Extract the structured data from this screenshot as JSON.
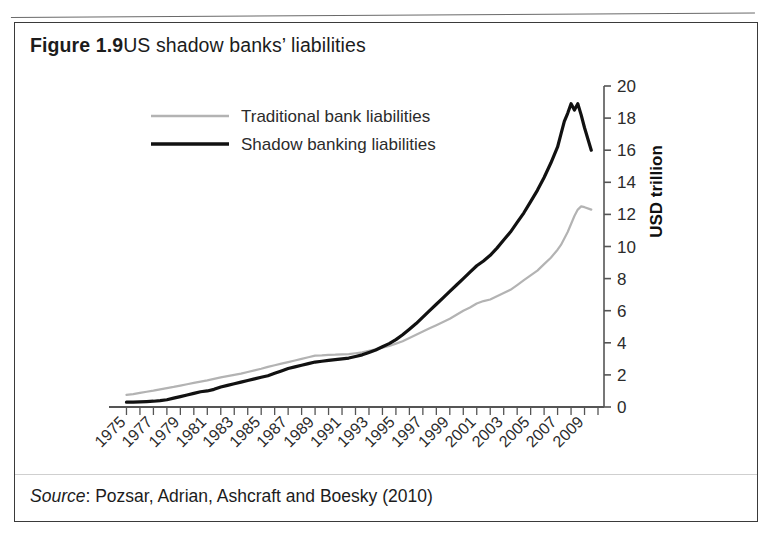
{
  "figure": {
    "number": "Figure 1.9",
    "caption": "US shadow banks’ liabilities",
    "source_label": "Source",
    "source_text": ": Pozsar, Adrian, Ashcraft and Boesky (2010)"
  },
  "colors": {
    "shadow_line": "#111111",
    "traditional_line": "#b3b3b3",
    "axis": "#555555",
    "text": "#1c1c1c",
    "border": "#3a3a3a",
    "background": "#ffffff"
  },
  "chart_data": {
    "type": "line",
    "title": "US shadow banks’ liabilities",
    "xlabel": "",
    "ylabel": "USD trillion",
    "xlim": [
      1974,
      2010
    ],
    "ylim": [
      0,
      20
    ],
    "ytick_step": 2,
    "yticks": [
      0,
      2,
      4,
      6,
      8,
      10,
      12,
      14,
      16,
      18,
      20
    ],
    "ytick_labels": [
      "0",
      "2",
      "4",
      "6",
      "8",
      "10",
      "12",
      "14",
      "16",
      "18",
      "20"
    ],
    "xticks": [
      1975,
      1977,
      1979,
      1981,
      1983,
      1985,
      1987,
      1989,
      1991,
      1993,
      1995,
      1997,
      1999,
      2001,
      2003,
      2005,
      2007,
      2009
    ],
    "xtick_labels": [
      "1975",
      "1977",
      "1979",
      "1981",
      "1983",
      "1985",
      "1987",
      "1989",
      "1991",
      "1993",
      "1995",
      "1997",
      "1999",
      "2001",
      "2003",
      "2005",
      "2007",
      "2009"
    ],
    "xtick_minor_every": 1,
    "xtick_label_rotation": -45,
    "grid": false,
    "legend_position": "upper-left-inside",
    "axis_position": "right",
    "x": [
      1975,
      1975.5,
      1976,
      1976.5,
      1977,
      1977.5,
      1978,
      1978.5,
      1979,
      1979.5,
      1980,
      1980.5,
      1981,
      1981.5,
      1982,
      1982.5,
      1983,
      1983.5,
      1984,
      1984.5,
      1985,
      1985.5,
      1986,
      1986.5,
      1987,
      1987.5,
      1988,
      1988.5,
      1989,
      1989.5,
      1990,
      1990.5,
      1991,
      1991.5,
      1992,
      1992.5,
      1993,
      1993.5,
      1994,
      1994.5,
      1995,
      1995.5,
      1996,
      1996.5,
      1997,
      1997.5,
      1998,
      1998.5,
      1999,
      1999.5,
      2000,
      2000.5,
      2001,
      2001.5,
      2002,
      2002.5,
      2003,
      2003.5,
      2004,
      2004.5,
      2005,
      2005.5,
      2006,
      2006.5,
      2007,
      2007.25,
      2007.5,
      2007.75,
      2008,
      2008.25,
      2008.5,
      2008.75,
      2009,
      2009.5
    ],
    "series": [
      {
        "name": "Traditional bank liabilities",
        "color": "#b3b3b3",
        "linewidth": 2.2,
        "values": [
          0.75,
          0.8,
          0.88,
          0.95,
          1.02,
          1.1,
          1.18,
          1.25,
          1.33,
          1.42,
          1.5,
          1.58,
          1.66,
          1.75,
          1.85,
          1.92,
          2.0,
          2.08,
          2.18,
          2.28,
          2.38,
          2.5,
          2.6,
          2.7,
          2.8,
          2.9,
          3.0,
          3.1,
          3.2,
          3.22,
          3.25,
          3.26,
          3.28,
          3.3,
          3.35,
          3.4,
          3.5,
          3.6,
          3.7,
          3.8,
          3.95,
          4.1,
          4.3,
          4.5,
          4.7,
          4.9,
          5.1,
          5.3,
          5.5,
          5.75,
          6.0,
          6.2,
          6.45,
          6.6,
          6.7,
          6.9,
          7.1,
          7.3,
          7.6,
          7.9,
          8.2,
          8.5,
          8.9,
          9.3,
          9.8,
          10.1,
          10.5,
          10.9,
          11.4,
          11.9,
          12.3,
          12.5,
          12.45,
          12.3
        ]
      },
      {
        "name": "Shadow banking liabilities",
        "color": "#111111",
        "linewidth": 3.2,
        "values": [
          0.3,
          0.3,
          0.32,
          0.34,
          0.36,
          0.4,
          0.45,
          0.55,
          0.65,
          0.75,
          0.85,
          0.95,
          1.0,
          1.1,
          1.25,
          1.35,
          1.45,
          1.55,
          1.65,
          1.75,
          1.85,
          1.95,
          2.1,
          2.25,
          2.4,
          2.5,
          2.6,
          2.7,
          2.8,
          2.85,
          2.9,
          2.95,
          3.0,
          3.05,
          3.15,
          3.25,
          3.4,
          3.55,
          3.75,
          3.95,
          4.2,
          4.5,
          4.85,
          5.2,
          5.6,
          6.0,
          6.4,
          6.8,
          7.2,
          7.6,
          8.0,
          8.4,
          8.8,
          9.1,
          9.45,
          9.9,
          10.4,
          10.9,
          11.5,
          12.1,
          12.8,
          13.5,
          14.3,
          15.2,
          16.2,
          17.0,
          17.8,
          18.3,
          18.9,
          18.5,
          18.9,
          18.2,
          17.4,
          16.0
        ]
      }
    ],
    "annotations": [
      {
        "text": "Shadow banking liabilities exceed traditional bank liabilities from about 1994 onward",
        "visible": false
      }
    ]
  },
  "legend": {
    "items": [
      {
        "label": "Traditional bank liabilities",
        "color": "#b3b3b3"
      },
      {
        "label": "Shadow banking liabilities",
        "color": "#111111"
      }
    ]
  }
}
